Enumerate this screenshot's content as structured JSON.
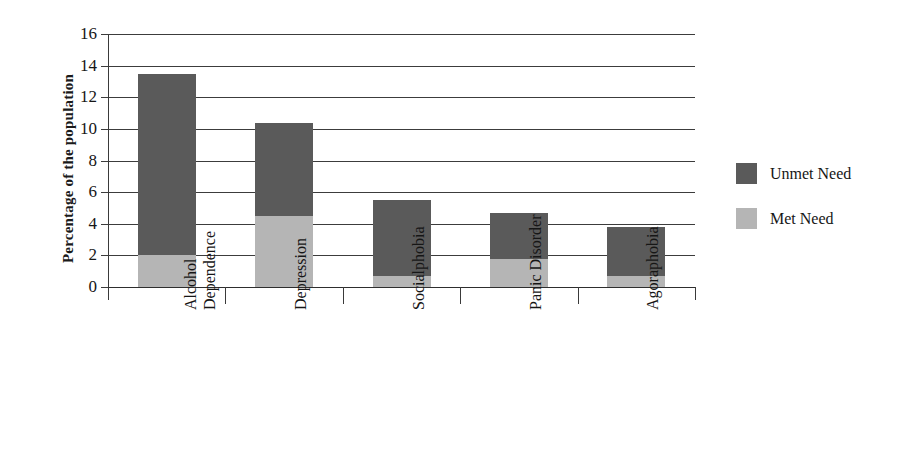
{
  "chart_data": {
    "type": "bar",
    "subtype": "stacked-bar",
    "title": "",
    "xlabel": "",
    "ylabel": "Percentage of the population",
    "ylim": [
      0,
      16
    ],
    "yticks": [
      0,
      2,
      4,
      6,
      8,
      10,
      12,
      14,
      16
    ],
    "ytick_labels": [
      "0",
      "2",
      "4",
      "6",
      "8",
      "10",
      "12",
      "14",
      "16"
    ],
    "grid": true,
    "grid_axis": "y",
    "legend_position": "right",
    "categories": [
      "Alcohol Dependence",
      "Depression",
      "Socialphobia",
      "Panic Disorder",
      "Agoraphobia"
    ],
    "category_lines": [
      [
        "Alcohol",
        "Dependence"
      ],
      [
        "Depression"
      ],
      [
        "Socialphobia"
      ],
      [
        "Panic Disorder"
      ],
      [
        "Agoraphobia"
      ]
    ],
    "series": [
      {
        "name": "Met Need",
        "color": "#b5b5b5",
        "values": [
          2.0,
          4.5,
          0.7,
          1.8,
          0.7
        ]
      },
      {
        "name": "Unmet Need",
        "color": "#5a5a5a",
        "values": [
          11.5,
          5.9,
          4.8,
          2.9,
          3.1
        ]
      }
    ],
    "totals": [
      13.5,
      10.4,
      5.5,
      4.7,
      3.8
    ],
    "annotations": []
  },
  "axis": {
    "y_title": "Percentage of the population"
  },
  "legend": {
    "items": [
      {
        "label": "Unmet Need",
        "color": "#5a5a5a"
      },
      {
        "label": "Met Need",
        "color": "#b5b5b5"
      }
    ]
  }
}
